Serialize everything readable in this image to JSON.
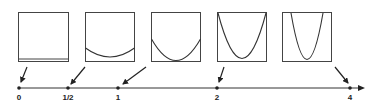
{
  "diagram": {
    "type": "parameter-line-with-parabola-panels",
    "axis": {
      "ticks": [
        {
          "label": "0",
          "value": 0
        },
        {
          "label": "1/2",
          "value": 0.5
        },
        {
          "label": "1",
          "value": 1
        },
        {
          "label": "2",
          "value": 2
        },
        {
          "label": "4",
          "value": 4
        }
      ],
      "arrow_direction": "right"
    },
    "panels": [
      {
        "id": "panel-0",
        "points_to": "0",
        "curve": "flat line at bottom"
      },
      {
        "id": "panel-half",
        "points_to": "1/2",
        "curve": "shallow parabola"
      },
      {
        "id": "panel-1",
        "points_to": "1",
        "curve": "moderate parabola"
      },
      {
        "id": "panel-2",
        "points_to": "2",
        "curve": "steep parabola"
      },
      {
        "id": "panel-4",
        "points_to": "4",
        "curve": "very steep parabola"
      }
    ],
    "colors": {
      "line": "#333333",
      "background": "#ffffff"
    }
  }
}
